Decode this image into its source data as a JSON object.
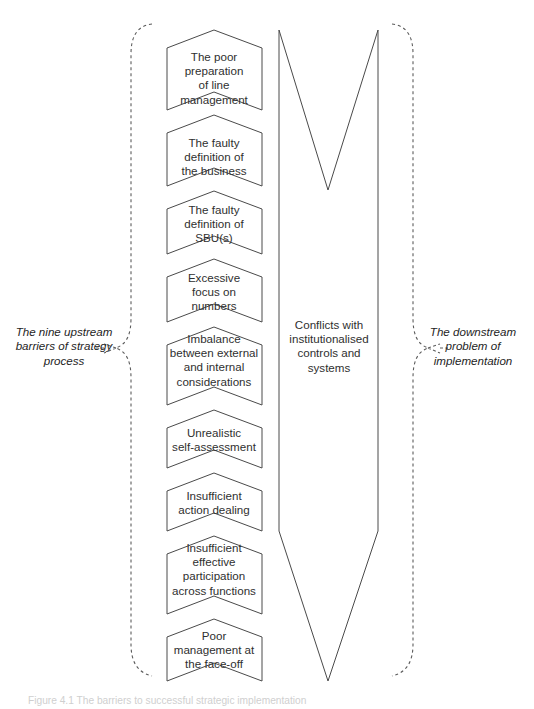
{
  "figure": {
    "caption": "Figure 4.1  The barriers to successful strategic implementation"
  },
  "left_brace_label": "The nine upstream barriers of strategy process",
  "right_brace_label": "The downstream problem of implementation",
  "upstream_barriers": [
    {
      "id": "barrier-1",
      "label": "The poor preparation of line management",
      "lines": [
        "The poor",
        "preparation",
        "of line",
        "management"
      ]
    },
    {
      "id": "barrier-2",
      "label": "The faulty definition of the business",
      "lines": [
        "The faulty",
        "definition of",
        "the business"
      ]
    },
    {
      "id": "barrier-3",
      "label": "The faulty definition of SBU(s)",
      "lines": [
        "The faulty",
        "definition of",
        "SBU(s)"
      ]
    },
    {
      "id": "barrier-4",
      "label": "Excessive focus on numbers",
      "lines": [
        "Excessive",
        "focus on",
        "numbers"
      ]
    },
    {
      "id": "barrier-5",
      "label": "Imbalance between external and internal considerations",
      "lines": [
        "Imbalance",
        "between external",
        "and internal",
        "considerations"
      ]
    },
    {
      "id": "barrier-6",
      "label": "Unrealistic self-assessment",
      "lines": [
        "Unrealistic",
        "self-assessment"
      ]
    },
    {
      "id": "barrier-7",
      "label": "Insufficient action dealing",
      "lines": [
        "Insufficient",
        "action dealing"
      ]
    },
    {
      "id": "barrier-8",
      "label": "Insufficient effective participation across functions",
      "lines": [
        "Insufficient",
        "effective",
        "participation",
        "across functions"
      ]
    },
    {
      "id": "barrier-9",
      "label": "Poor management at the face-off",
      "lines": [
        "Poor",
        "management at",
        "the face-off"
      ]
    }
  ],
  "downstream_problem": {
    "label": "Conflicts with institutionalised controls and systems",
    "lines": [
      "Conflicts with",
      "institutionalised",
      "controls and",
      "systems"
    ]
  },
  "colors": {
    "stroke": "#4a4a4a",
    "brace": "#5c5c5c",
    "text": "#2f2f2f",
    "background": "#ffffff",
    "caption": "#cfcfcf"
  }
}
